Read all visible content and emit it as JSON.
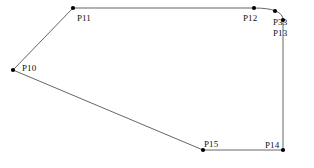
{
  "figure": {
    "width": 314,
    "height": 168,
    "background_color": "#ffffff",
    "line_color": "#555555",
    "line_width": 0.9,
    "vertex_dot_color": "#000000",
    "vertex_dot_radius": 2.1,
    "label_color": "#111111",
    "label_font_size": 9
  },
  "chart_data": {
    "type": "scatter",
    "xlabel": "",
    "ylabel": "",
    "xlim": [
      0,
      314
    ],
    "ylim": [
      168,
      0
    ],
    "grid": false,
    "legend": "none",
    "points": [
      {
        "name": "P10",
        "x": 13,
        "y": 70
      },
      {
        "name": "P11",
        "x": 73,
        "y": 8
      },
      {
        "name": "P12",
        "x": 254,
        "y": 8
      },
      {
        "name": "P33",
        "x": 275,
        "y": 11
      },
      {
        "name": "P13",
        "x": 283,
        "y": 20
      },
      {
        "name": "P14",
        "x": 283,
        "y": 150
      },
      {
        "name": "P15",
        "x": 203,
        "y": 150
      }
    ],
    "edges": [
      {
        "from": "P10",
        "to": "P11",
        "kind": "line"
      },
      {
        "from": "P11",
        "to": "P12",
        "kind": "line"
      },
      {
        "from": "P12",
        "to": "P13",
        "kind": "arc",
        "through": "P33"
      },
      {
        "from": "P13",
        "to": "P14",
        "kind": "line"
      },
      {
        "from": "P14",
        "to": "P15",
        "kind": "line"
      },
      {
        "from": "P15",
        "to": "P10",
        "kind": "line"
      }
    ],
    "path_d": "M 13 70 L 73 8 L 254 8 Q 283 8 283 20 L 283 150 L 203 150 Z"
  },
  "labels": {
    "p10": {
      "text": "P10",
      "x": 22,
      "y": 63
    },
    "p11": {
      "text": "P11",
      "x": 77,
      "y": 13
    },
    "p12": {
      "text": "P12",
      "x": 243,
      "y": 13
    },
    "p33": {
      "text": "P33",
      "x": 273,
      "y": 17
    },
    "p13": {
      "text": "P13",
      "x": 273,
      "y": 28
    },
    "p14": {
      "text": "P14",
      "x": 265,
      "y": 140
    },
    "p15": {
      "text": "P15",
      "x": 204,
      "y": 139
    }
  }
}
